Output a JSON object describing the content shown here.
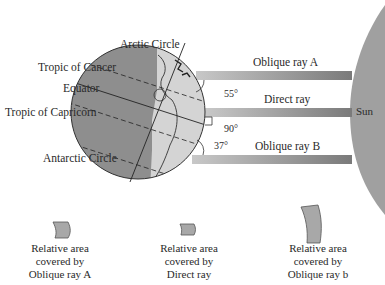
{
  "diagram": {
    "globe_labels": {
      "arctic": "Arctic Circle",
      "cancer": "Tropic of Cancer",
      "equator": "Equator",
      "capricorn": "Tropic of Capricorn",
      "antarctic": "Antarctic Circle"
    },
    "rays": [
      {
        "label": "Oblique ray A",
        "angle": "55°"
      },
      {
        "label": "Direct ray",
        "angle": "90°"
      },
      {
        "label": "Oblique ray B",
        "angle": "37°"
      }
    ],
    "sun_label": "Sun",
    "captions": [
      {
        "line1": "Relative area",
        "line2": "covered by",
        "line3": "Oblique ray A"
      },
      {
        "line1": "Relative area",
        "line2": "covered by",
        "line3": "Direct ray"
      },
      {
        "line1": "Relative area",
        "line2": "covered by",
        "line3": "Oblique ray b"
      }
    ],
    "colors": {
      "night_side": "#8e8e8e",
      "day_side": "#d4d4d4",
      "ray": "#8a8a8a",
      "sun": "#a0a0a0",
      "patch": "#a8a8a8"
    }
  }
}
